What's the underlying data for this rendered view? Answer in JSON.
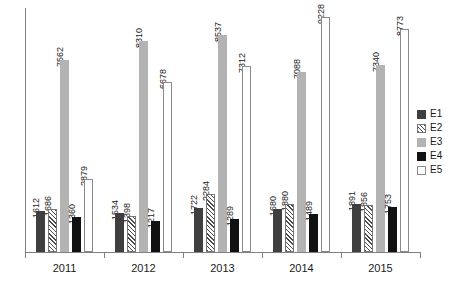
{
  "chart_data": {
    "type": "bar",
    "title": "",
    "subtitle": "",
    "xlabel": "",
    "ylabel": "",
    "grid": false,
    "legend_position": "right",
    "axis": {
      "y_visible": true,
      "y_tick_labels": [],
      "x_visible": true,
      "ymin": 0,
      "ymax": 9600
    },
    "categories": [
      "2011",
      "2012",
      "2013",
      "2014",
      "2015"
    ],
    "series": [
      {
        "name": "E1",
        "style": "solid-dark-gray",
        "color": "#3f3f3f",
        "values": [
          1612,
          1534,
          1722,
          1680,
          1891
        ]
      },
      {
        "name": "E2",
        "style": "diagonal-hatch",
        "color": "#4a4a4a",
        "values": [
          1686,
          1398,
          2284,
          1880,
          1856
        ]
      },
      {
        "name": "E3",
        "style": "solid-light-gray",
        "color": "#b3b3b3",
        "values": [
          7562,
          8310,
          8537,
          7088,
          7340
        ]
      },
      {
        "name": "E4",
        "style": "solid-black",
        "color": "#111111",
        "values": [
          1360,
          1217,
          1289,
          1489,
          1753
        ]
      },
      {
        "name": "E5",
        "style": "dotted-stipple",
        "color": "#4a4a4a",
        "values": [
          2879,
          6678,
          7312,
          9228,
          8773
        ]
      }
    ],
    "data_labels": [
      [
        "1612",
        "1686",
        "7562",
        "1360",
        "2879"
      ],
      [
        "1534",
        "1398",
        "8310",
        "1217",
        "6678"
      ],
      [
        "1722",
        "2284",
        "8537",
        "1289",
        "7312"
      ],
      [
        "1680",
        "1880",
        "7088",
        "1489",
        "9228"
      ],
      [
        "1891",
        "1856",
        "7340",
        "1753",
        "8773"
      ]
    ]
  },
  "legend": {
    "items": [
      {
        "label": "E1"
      },
      {
        "label": "E2"
      },
      {
        "label": "E3"
      },
      {
        "label": "E4"
      },
      {
        "label": "E5"
      }
    ]
  }
}
